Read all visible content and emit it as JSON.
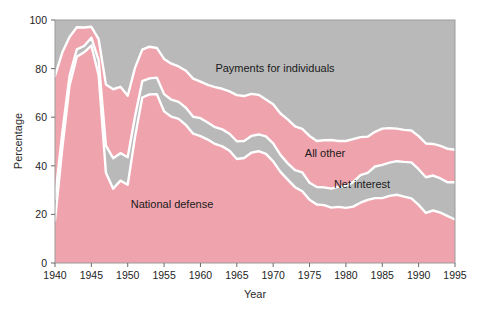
{
  "chart_data": {
    "type": "area",
    "title": "",
    "xlabel": "Year",
    "ylabel": "Percentage",
    "xlim": [
      1940,
      1995
    ],
    "ylim": [
      0,
      100
    ],
    "grid": false,
    "stacked": true,
    "legend_position": "inline-annotations",
    "xticks": [
      1940,
      1945,
      1950,
      1955,
      1960,
      1965,
      1970,
      1975,
      1980,
      1985,
      1990,
      1995
    ],
    "xtick_labels": [
      "1940",
      "1945",
      "1950",
      "1955",
      "1960",
      "1965",
      "1970",
      "1975",
      "1980",
      "1985",
      "1990",
      "1995"
    ],
    "yticks": [
      0,
      20,
      40,
      60,
      80,
      100
    ],
    "ytick_labels": [
      "0",
      "20",
      "40",
      "60",
      "80",
      "100"
    ],
    "x": [
      1940,
      1941,
      1942,
      1943,
      1944,
      1945,
      1946,
      1947,
      1948,
      1949,
      1950,
      1951,
      1952,
      1953,
      1954,
      1955,
      1956,
      1957,
      1958,
      1959,
      1960,
      1961,
      1962,
      1963,
      1964,
      1965,
      1966,
      1967,
      1968,
      1969,
      1970,
      1971,
      1972,
      1973,
      1974,
      1975,
      1976,
      1977,
      1978,
      1979,
      1980,
      1981,
      1982,
      1983,
      1984,
      1985,
      1986,
      1987,
      1988,
      1989,
      1990,
      1991,
      1992,
      1993,
      1994,
      1995
    ],
    "series": [
      {
        "name": "National defense",
        "color": "#efa3ad",
        "values": [
          17.5,
          47.1,
          73.0,
          84.9,
          86.7,
          89.5,
          77.3,
          37.1,
          30.6,
          33.9,
          32.2,
          51.8,
          68.1,
          69.4,
          69.5,
          62.4,
          60.2,
          59.3,
          56.8,
          53.2,
          52.2,
          50.8,
          49.0,
          48.0,
          46.2,
          42.8,
          43.2,
          45.4,
          46.0,
          44.9,
          41.8,
          37.5,
          34.3,
          31.2,
          29.5,
          26.0,
          24.1,
          23.8,
          22.8,
          23.1,
          22.7,
          23.2,
          24.8,
          26.0,
          26.7,
          26.7,
          27.6,
          28.1,
          27.3,
          26.6,
          23.9,
          20.6,
          21.6,
          20.7,
          19.3,
          17.9
        ]
      },
      {
        "name": "Net interest",
        "color": "#b9b9b9",
        "values": [
          9.0,
          6.5,
          4.0,
          3.0,
          2.6,
          3.2,
          6.2,
          11.2,
          12.5,
          11.3,
          11.3,
          8.5,
          6.7,
          6.6,
          6.8,
          7.1,
          7.0,
          7.0,
          7.1,
          7.0,
          7.4,
          7.0,
          6.9,
          7.0,
          7.0,
          7.3,
          7.0,
          6.9,
          6.9,
          7.2,
          7.4,
          7.0,
          6.7,
          7.0,
          7.8,
          7.0,
          7.2,
          7.3,
          7.8,
          8.3,
          8.9,
          10.1,
          11.4,
          11.1,
          13.0,
          13.7,
          13.7,
          13.8,
          14.3,
          14.8,
          14.7,
          14.7,
          14.4,
          14.1,
          13.9,
          15.3
        ]
      },
      {
        "name": "All other",
        "color": "#efa3ad",
        "values": [
          50.5,
          33.0,
          16.0,
          9.1,
          7.6,
          4.5,
          8.6,
          25.2,
          28.4,
          27.3,
          25.3,
          20.0,
          13.0,
          13.0,
          12.2,
          14.5,
          14.8,
          14.6,
          15.2,
          15.7,
          15.0,
          15.5,
          16.5,
          16.7,
          17.4,
          19.0,
          18.5,
          17.3,
          16.3,
          15.2,
          16.1,
          17.0,
          18.1,
          18.0,
          17.9,
          19.3,
          18.9,
          19.4,
          20.0,
          18.8,
          18.6,
          17.7,
          15.6,
          14.9,
          14.3,
          14.9,
          14.2,
          13.4,
          13.2,
          13.1,
          13.6,
          13.9,
          13.0,
          13.4,
          13.8,
          13.4
        ]
      },
      {
        "name": "Payments for individuals",
        "color": "#b9b9b9",
        "values": [
          23.0,
          13.4,
          7.0,
          3.0,
          3.1,
          2.8,
          7.9,
          26.5,
          28.5,
          27.5,
          31.2,
          19.7,
          12.2,
          11.0,
          11.5,
          16.0,
          18.0,
          19.1,
          20.9,
          24.1,
          25.4,
          26.7,
          27.6,
          28.3,
          29.4,
          30.9,
          31.3,
          30.4,
          30.8,
          32.7,
          34.7,
          38.5,
          40.9,
          43.8,
          44.8,
          47.7,
          49.8,
          49.5,
          49.4,
          49.8,
          49.8,
          49.0,
          48.2,
          48.0,
          46.0,
          44.7,
          44.5,
          44.7,
          45.2,
          45.5,
          47.8,
          50.8,
          51.0,
          51.8,
          53.0,
          53.4
        ]
      }
    ],
    "annotations": [
      {
        "text": "Payments for individuals",
        "x_px": 275,
        "y_px": 72
      },
      {
        "text": "All other",
        "x_px": 325,
        "y_px": 157
      },
      {
        "text": "Net interest",
        "x_px": 362,
        "y_px": 188
      },
      {
        "text": "National defense",
        "x_px": 172,
        "y_px": 208
      }
    ]
  },
  "colors": {
    "pink": "#efa3ad",
    "gray": "#b9b9b9",
    "separator": "#ffffff",
    "frame": "#9b9b9b",
    "text": "#1a1a1a",
    "background": "#ffffff"
  }
}
